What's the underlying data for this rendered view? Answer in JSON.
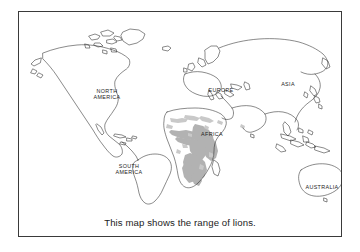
{
  "figure": {
    "caption": "This map shows the range of lions.",
    "border_color": "#3a3a3a",
    "background_color": "#ffffff",
    "coastline_color": "#2b2b2b",
    "range_shade_color": "#b2b2b2"
  },
  "map": {
    "type": "world-outline-map",
    "projection_note": "equirectangular world map, outline style",
    "labels": [
      {
        "id": "north-america",
        "text": "NORTH\nAMERICA",
        "x": 88,
        "y": 82
      },
      {
        "id": "south-america",
        "text": "SOUTH\nAMERICA",
        "x": 110,
        "y": 157
      },
      {
        "id": "europe",
        "text": "EUROPE",
        "x": 202,
        "y": 78
      },
      {
        "id": "africa",
        "text": "AFRICA",
        "x": 193,
        "y": 122
      },
      {
        "id": "asia",
        "text": "ASIA",
        "x": 269,
        "y": 72
      },
      {
        "id": "australia",
        "text": "AUSTRALIA",
        "x": 303,
        "y": 175
      }
    ],
    "legend_note": "Shaded gray areas indicate lion range",
    "range_regions": [
      "sub-Saharan Africa",
      "East Africa",
      "Southern Africa",
      "Sahel / North Africa traces",
      "Northwest India (Gir)"
    ]
  }
}
